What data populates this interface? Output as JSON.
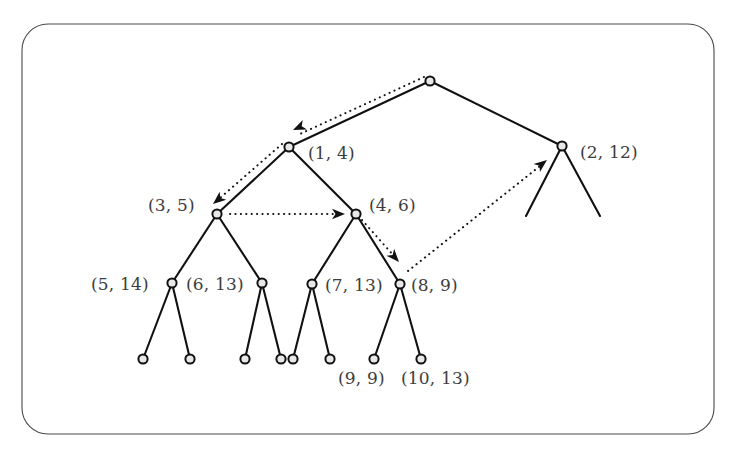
{
  "figure": {
    "background_color": "#ffffff",
    "frame": {
      "name": "rounded-rectangle-border",
      "x": 22,
      "y": 24,
      "width": 692,
      "height": 410,
      "radius": 26,
      "stroke_color": "#4a4a4a"
    },
    "node_style": {
      "fill_color": "#e8e8e8",
      "stroke_color": "#111111",
      "radius": 4.6
    },
    "edge_color": "#111111",
    "label_color": "#3d3d3d"
  },
  "nodes": [
    {
      "id": "root",
      "label": "",
      "cx": 430,
      "cy": 81,
      "label_x": 0,
      "label_y": 0,
      "has_label": false
    },
    {
      "id": "n1",
      "label": "(1, 4)",
      "cx": 289,
      "cy": 147,
      "label_x": 308,
      "label_y": 159,
      "has_label": true
    },
    {
      "id": "n2",
      "label": "(2, 12)",
      "cx": 562,
      "cy": 146,
      "label_x": 580,
      "label_y": 158,
      "has_label": true
    },
    {
      "id": "n3",
      "label": "(3, 5)",
      "cx": 217,
      "cy": 214,
      "label_x": 148,
      "label_y": 211,
      "has_label": true
    },
    {
      "id": "n4",
      "label": "(4, 6)",
      "cx": 356,
      "cy": 214,
      "label_x": 369,
      "label_y": 211,
      "has_label": true
    },
    {
      "id": "n5",
      "label": "(5, 14)",
      "cx": 172,
      "cy": 283,
      "label_x": 91,
      "label_y": 290,
      "has_label": true
    },
    {
      "id": "n6",
      "label": "(6, 13)",
      "cx": 262,
      "cy": 283,
      "label_x": 186,
      "label_y": 290,
      "has_label": true
    },
    {
      "id": "n7",
      "label": "(7, 13)",
      "cx": 312,
      "cy": 284,
      "label_x": 325,
      "label_y": 291,
      "has_label": true
    },
    {
      "id": "n8",
      "label": "(8, 9)",
      "cx": 400,
      "cy": 284,
      "label_x": 411,
      "label_y": 291,
      "has_label": true
    },
    {
      "id": "l1",
      "label": "",
      "cx": 143,
      "cy": 359,
      "label_x": 0,
      "label_y": 0,
      "has_label": false
    },
    {
      "id": "l2",
      "label": "",
      "cx": 190,
      "cy": 359,
      "label_x": 0,
      "label_y": 0,
      "has_label": false
    },
    {
      "id": "l3",
      "label": "",
      "cx": 245,
      "cy": 359,
      "label_x": 0,
      "label_y": 0,
      "has_label": false
    },
    {
      "id": "l4",
      "label": "",
      "cx": 281,
      "cy": 359,
      "label_x": 0,
      "label_y": 0,
      "has_label": false
    },
    {
      "id": "l5",
      "label": "",
      "cx": 293,
      "cy": 359,
      "label_x": 0,
      "label_y": 0,
      "has_label": false
    },
    {
      "id": "l6",
      "label": "",
      "cx": 330,
      "cy": 359,
      "label_x": 0,
      "label_y": 0,
      "has_label": false
    },
    {
      "id": "l7",
      "label": "(9, 9)",
      "cx": 374,
      "cy": 359,
      "label_x": 338,
      "label_y": 384,
      "has_label": true
    },
    {
      "id": "l8",
      "label": "(10, 13)",
      "cx": 421,
      "cy": 359,
      "label_x": 401,
      "label_y": 384,
      "has_label": true
    }
  ],
  "edges": [
    {
      "from": "root",
      "to": "n1",
      "x1": 430,
      "y1": 81,
      "x2": 289,
      "y2": 147
    },
    {
      "from": "root",
      "to": "n2",
      "x1": 430,
      "y1": 81,
      "x2": 562,
      "y2": 146
    },
    {
      "from": "n1",
      "to": "n3",
      "x1": 289,
      "y1": 147,
      "x2": 217,
      "y2": 214
    },
    {
      "from": "n1",
      "to": "n4",
      "x1": 289,
      "y1": 147,
      "x2": 356,
      "y2": 214
    },
    {
      "from": "n2",
      "to": "s1",
      "x1": 562,
      "y1": 146,
      "x2": 526,
      "y2": 216
    },
    {
      "from": "n2",
      "to": "s2",
      "x1": 562,
      "y1": 146,
      "x2": 600,
      "y2": 216
    },
    {
      "from": "n3",
      "to": "n5",
      "x1": 217,
      "y1": 214,
      "x2": 172,
      "y2": 283
    },
    {
      "from": "n3",
      "to": "n6",
      "x1": 217,
      "y1": 214,
      "x2": 262,
      "y2": 283
    },
    {
      "from": "n4",
      "to": "n7",
      "x1": 356,
      "y1": 214,
      "x2": 312,
      "y2": 284
    },
    {
      "from": "n4",
      "to": "n8",
      "x1": 356,
      "y1": 214,
      "x2": 400,
      "y2": 284
    },
    {
      "from": "n5",
      "to": "l1",
      "x1": 172,
      "y1": 283,
      "x2": 143,
      "y2": 359
    },
    {
      "from": "n5",
      "to": "l2",
      "x1": 172,
      "y1": 283,
      "x2": 190,
      "y2": 359
    },
    {
      "from": "n6",
      "to": "l3",
      "x1": 262,
      "y1": 283,
      "x2": 245,
      "y2": 359
    },
    {
      "from": "n6",
      "to": "l4",
      "x1": 262,
      "y1": 283,
      "x2": 281,
      "y2": 359
    },
    {
      "from": "n7",
      "to": "l5",
      "x1": 312,
      "y1": 284,
      "x2": 293,
      "y2": 359
    },
    {
      "from": "n7",
      "to": "l6",
      "x1": 312,
      "y1": 284,
      "x2": 330,
      "y2": 359
    },
    {
      "from": "n8",
      "to": "l7",
      "x1": 400,
      "y1": 284,
      "x2": 374,
      "y2": 359
    },
    {
      "from": "n8",
      "to": "l8",
      "x1": 400,
      "y1": 284,
      "x2": 421,
      "y2": 359
    }
  ],
  "pointers": [
    {
      "id": "p1",
      "description": "root to node (1, 4)",
      "x1": 424,
      "y1": 77,
      "x2": 300,
      "y2": 134,
      "head_x": 293,
      "head_y": 130,
      "head_angle": 156
    },
    {
      "id": "p2",
      "description": "node (1, 4) to node (3, 5)",
      "x1": 282,
      "y1": 144,
      "x2": 220,
      "y2": 198,
      "head_x": 213,
      "head_y": 204,
      "head_angle": 140
    },
    {
      "id": "p3",
      "description": "node (3, 5) to node (4, 6)",
      "x1": 230,
      "y1": 214,
      "x2": 334,
      "y2": 214,
      "head_x": 345,
      "head_y": 214,
      "head_angle": 0
    },
    {
      "id": "p4",
      "description": "node (4, 6) to node (8, 9)",
      "x1": 362,
      "y1": 220,
      "x2": 394,
      "y2": 256,
      "head_x": 399,
      "head_y": 262,
      "head_angle": 48
    },
    {
      "id": "p5",
      "description": "node (8, 9) to node (2, 12)",
      "x1": 408,
      "y1": 271,
      "x2": 540,
      "y2": 166,
      "head_x": 547,
      "head_y": 160,
      "head_angle": -38
    }
  ]
}
